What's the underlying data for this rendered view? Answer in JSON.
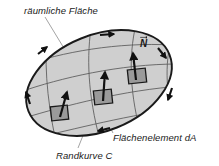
{
  "figure": {
    "title_labels": {
      "surface": "räumliche Fläche",
      "boundary": "Randkurve C",
      "element": "Flächenelement dA",
      "normal": "N"
    },
    "colors": {
      "surface_fill": "#cfcfcf",
      "surface_stroke": "#1a1a1a",
      "mesh_stroke": "#5a5a5a",
      "square_fill": "#9a9a9a",
      "square_stroke": "#1a1a1a",
      "arrow_color": "#111111",
      "leader_color": "#8c8c8c",
      "text_color": "#1a1a1a",
      "background": "#ffffff"
    },
    "geometry": {
      "ellipse_center_x": 99,
      "ellipse_center_y": 83,
      "ellipse_rx": 76,
      "ellipse_ry": 48,
      "ellipse_rotation_deg": -22
    },
    "normal_vectors": [
      {
        "name": "normal-vector-left",
        "x": 60,
        "y": 114
      },
      {
        "name": "normal-vector-center",
        "x": 103,
        "y": 97
      },
      {
        "name": "normal-vector-right",
        "x": 137,
        "y": 76
      }
    ],
    "orientation_arrow_count": 6,
    "mesh_line_count": 7
  }
}
